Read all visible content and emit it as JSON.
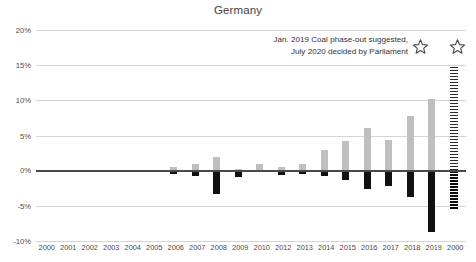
{
  "chart_data": {
    "type": "bar",
    "title": "Germany",
    "xlabel": "",
    "ylabel": "",
    "ylim": [
      -10,
      20
    ],
    "yticks": [
      "-10%",
      "-5%",
      "0%",
      "5%",
      "10%",
      "15%",
      "20%"
    ],
    "ytick_values": [
      -10,
      -5,
      0,
      5,
      10,
      15,
      20
    ],
    "grid": true,
    "legend": "none",
    "categories": [
      "2000",
      "2001",
      "2002",
      "2003",
      "2004",
      "2005",
      "2006",
      "2007",
      "2008",
      "2009",
      "2010",
      "2012",
      "2013",
      "2014",
      "2015",
      "2016",
      "2017",
      "2018",
      "2019",
      "2000"
    ],
    "series": [
      {
        "name": "positive",
        "color": "#bfbfbf",
        "values": [
          0,
          0,
          0,
          0,
          0.1,
          0.15,
          0.5,
          0.9,
          1.9,
          0.2,
          0.9,
          0.5,
          0.9,
          2.9,
          4.2,
          6.0,
          4.3,
          7.8,
          10.2,
          14.7
        ]
      },
      {
        "name": "negative",
        "color": "#111111",
        "values": [
          0,
          0,
          0,
          0,
          -0.15,
          -0.2,
          -0.5,
          -0.8,
          -3.3,
          -0.9,
          -0.25,
          -0.6,
          -0.5,
          -0.7,
          -1.3,
          -2.6,
          -2.2,
          -3.7,
          -8.7,
          -5.4
        ]
      }
    ],
    "projection_bar": {
      "label": "2000",
      "style": "hatched",
      "top": 7.6,
      "bottom": -4.0
    },
    "annotations": [
      {
        "line1": "Jan. 2019 Coal phase-out suggested,",
        "line2": "July 2020 decided by Parliament",
        "markers": [
          "star-1",
          "star-2"
        ]
      }
    ]
  },
  "axis": {
    "ytick_0": "20%",
    "ytick_1": "15%",
    "ytick_2": "10%",
    "ytick_3": "5%",
    "ytick_4": "0%",
    "ytick_5": "-5%",
    "ytick_6": "-10%"
  },
  "colors": {
    "positive_bar": "#bfbfbf",
    "negative_bar": "#111111",
    "gridline": "#d5d5d5",
    "zero_line": "#4a4a4a",
    "text": "#3a3a3a",
    "background": "#ffffff"
  }
}
